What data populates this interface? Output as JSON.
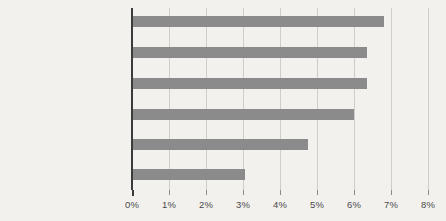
{
  "chart_data": {
    "type": "bar",
    "orientation": "horizontal",
    "title": "",
    "xlabel": "",
    "ylabel": "",
    "categories": [
      "Grandes metrópoles: condados urbanos",
      "Grandes metrópoles: subúrbios de maior densidade",
      "Grandes metrópoles: subúrbios de baixa densidade",
      "Metrópoles medianas",
      "Pequenas metrópoles",
      "Áreas não metropolitanas"
    ],
    "category_lines": [
      [
        "Grandes metrópoles:",
        "condados urbanos"
      ],
      [
        "Grandes metrópoles:",
        "subúrbios de maior densidade"
      ],
      [
        "Grandes metrópoles:",
        "subúrbios de baixa densidade"
      ],
      [
        "Metrópoles medianas"
      ],
      [
        "Pequenas metrópoles"
      ],
      [
        "Áreas não metropolitanas"
      ]
    ],
    "values": [
      6.8,
      6.35,
      6.35,
      6.0,
      4.75,
      3.05
    ],
    "value_labels": [
      "6,8%",
      "6,35%",
      "6,35%",
      "6,0%",
      "4,75%",
      "3,05%"
    ],
    "xlim": [
      0,
      8
    ],
    "xticks": [
      0,
      1,
      2,
      3,
      4,
      5,
      6,
      7,
      8
    ],
    "xticklabels": [
      "0%",
      "1%",
      "2%",
      "3%",
      "4%",
      "5%",
      "6%",
      "7%",
      "8%"
    ],
    "grid": true,
    "grid_axis": "x",
    "legend": null,
    "colors": {
      "bar": "#8b8b8b",
      "background": "#f3f1ee",
      "gridline": "#cfcdc9",
      "axis": "#3b3b3b",
      "text": "#3a3a3a",
      "tick_text": "#4a4a4a"
    }
  }
}
